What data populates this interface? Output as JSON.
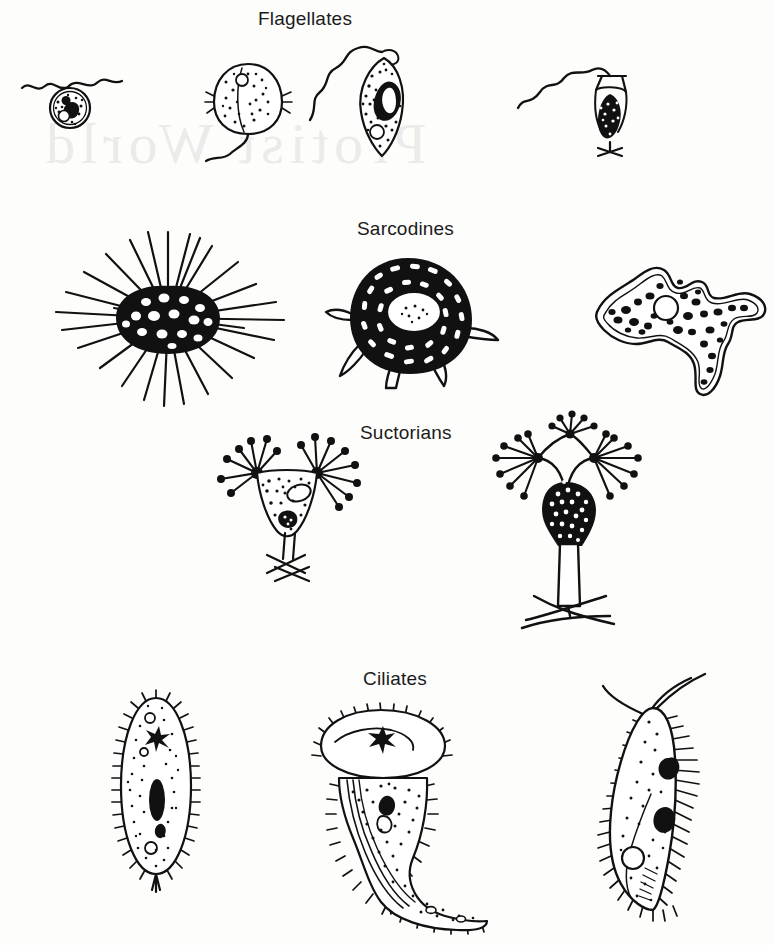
{
  "figure": {
    "kind": "scientific-line-illustration",
    "background_color": "#fdfdfc",
    "ink_color": "#111111",
    "label_color": "#1b1b1b",
    "ghost_text": {
      "note": "faint show-through text from reverse of scanned page",
      "line": "Protist World",
      "opacity": 0.18
    }
  },
  "groups": [
    {
      "id": "flagellates",
      "label": "Flagellates",
      "label_x": 258,
      "label_y": 8,
      "organisms": [
        {
          "name": "biflagellate-round-cell",
          "desc": "round cell with two anterior flagella and dark nucleus"
        },
        {
          "name": "oval-flagellate",
          "desc": "ovoid granular cell with single trailing flagellum"
        },
        {
          "name": "euglenoid-flagellate",
          "desc": "spindle cell with long whip flagellum and large nucleus"
        },
        {
          "name": "choanoflagellate-in-lorica",
          "desc": "collared flagellate in goblet lorica on forked stalk"
        }
      ]
    },
    {
      "id": "sarcodines",
      "label": "Sarcodines",
      "label_x": 357,
      "label_y": 218,
      "organisms": [
        {
          "name": "heliozoan",
          "desc": "spherical vacuolated body with radiating straight axopodia"
        },
        {
          "name": "testate-amoeba",
          "desc": "dark granular test with central nucleus and blunt pseudopodia"
        },
        {
          "name": "amoeba-proteus",
          "desc": "irregular lobose amoeba with granular cytoplasm and contractile vacuole"
        }
      ]
    },
    {
      "id": "suctorians",
      "label": "Suctorians",
      "label_x": 360,
      "label_y": 422,
      "organisms": [
        {
          "name": "suctorian-two-tufts",
          "desc": "triangular body with two tufts of knobbed tentacles on short forked stalk"
        },
        {
          "name": "branched-suctorian",
          "desc": "body with three arms bearing knobbed tentacle clusters on long stalk with holdfast"
        }
      ]
    },
    {
      "id": "ciliates",
      "label": "Ciliates",
      "label_x": 363,
      "label_y": 668,
      "organisms": [
        {
          "name": "paramecium",
          "desc": "ovoid uniformly ciliated cell with macronucleus and contractile vacuoles"
        },
        {
          "name": "trumpet-ciliate",
          "desc": "stentor-like trumpet body with flared oral ciliary disc and curved tapering tail"
        },
        {
          "name": "hypotrich-ciliate",
          "desc": "elongate ciliate with long cirri, two macronuclei and contractile vacuole"
        }
      ]
    }
  ]
}
